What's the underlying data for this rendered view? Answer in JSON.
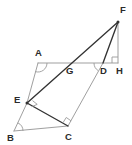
{
  "figure": {
    "width": 132,
    "height": 145,
    "background_color": "#ffffff",
    "stroke_dark": "#333333",
    "stroke_light": "#9a9a9a",
    "label_color": "#2b2b2b"
  },
  "points": [
    {
      "name": "F",
      "x": 118,
      "y": 22,
      "label": "F",
      "label_x": 120,
      "label_y": 13
    },
    {
      "name": "A",
      "x": 38,
      "y": 63,
      "label": "A",
      "label_x": 35,
      "label_y": 56
    },
    {
      "name": "G",
      "x": 68,
      "y": 63,
      "label": "G",
      "label_x": 66,
      "label_y": 74
    },
    {
      "name": "D",
      "x": 103,
      "y": 63,
      "label": "D",
      "label_x": 100,
      "label_y": 74
    },
    {
      "name": "H",
      "x": 118,
      "y": 63,
      "label": "H",
      "label_x": 116,
      "label_y": 74
    },
    {
      "name": "E",
      "x": 27,
      "y": 103,
      "label": "E",
      "label_x": 14,
      "label_y": 103
    },
    {
      "name": "B",
      "x": 14,
      "y": 131,
      "label": "B",
      "label_x": 7,
      "label_y": 141
    },
    {
      "name": "C",
      "x": 68,
      "y": 126,
      "label": "C",
      "label_x": 65,
      "label_y": 140
    }
  ],
  "segments": [
    {
      "name": "AH",
      "from": "A",
      "to": "H",
      "shade": "light",
      "description": "horizontal line through A, G, D to H"
    },
    {
      "name": "AE",
      "from": "A",
      "to": "E",
      "shade": "light",
      "description": "upper left side of parallelogram"
    },
    {
      "name": "EB",
      "from": "E",
      "to": "B",
      "shade": "light",
      "description": "lower left side of parallelogram"
    },
    {
      "name": "BC",
      "from": "B",
      "to": "C",
      "shade": "light",
      "description": "base of parallelogram"
    },
    {
      "name": "CD",
      "from": "C",
      "to": "D",
      "shade": "light",
      "description": "right side of parallelogram"
    },
    {
      "name": "FH",
      "from": "F",
      "to": "H",
      "shade": "light",
      "description": "vertical altitude from F to H"
    },
    {
      "name": "EF",
      "from": "E",
      "to": "F",
      "shade": "dark",
      "description": "line from E through G up to F"
    },
    {
      "name": "DF",
      "from": "D",
      "to": "F",
      "shade": "dark",
      "description": "line from D up to F"
    },
    {
      "name": "EC",
      "from": "E",
      "to": "C",
      "shade": "dark",
      "description": "line from E down to C"
    }
  ],
  "angle_marks": [
    {
      "name": "right-angle-at-H",
      "kind": "right",
      "vertex": "H",
      "dir_a": [
        -1,
        0
      ],
      "dir_b": [
        0,
        -1
      ],
      "size": 6
    },
    {
      "name": "right-angle-at-E",
      "kind": "right",
      "vertex": "E",
      "dir_a": [
        0.92,
        -0.4
      ],
      "dir_b": [
        0.78,
        0.62
      ],
      "size": 6
    },
    {
      "name": "right-angle-at-C",
      "kind": "right",
      "vertex": "C",
      "dir_a": [
        -0.82,
        -0.57
      ],
      "dir_b": [
        0.53,
        -0.85
      ],
      "size": 6
    },
    {
      "name": "arc-at-A",
      "kind": "arc",
      "vertex": "A",
      "dir_a": [
        1,
        0
      ],
      "dir_b": [
        -0.31,
        0.95
      ],
      "radius": 9
    },
    {
      "name": "arc-at-B",
      "kind": "arc",
      "vertex": "B",
      "dir_a": [
        1,
        0
      ],
      "dir_b": [
        0.42,
        -0.91
      ],
      "radius": 9
    },
    {
      "name": "arc-at-D",
      "kind": "arc",
      "vertex": "D",
      "dir_a": [
        -1,
        0
      ],
      "dir_b": [
        -0.53,
        0.85
      ],
      "radius": 9
    }
  ]
}
